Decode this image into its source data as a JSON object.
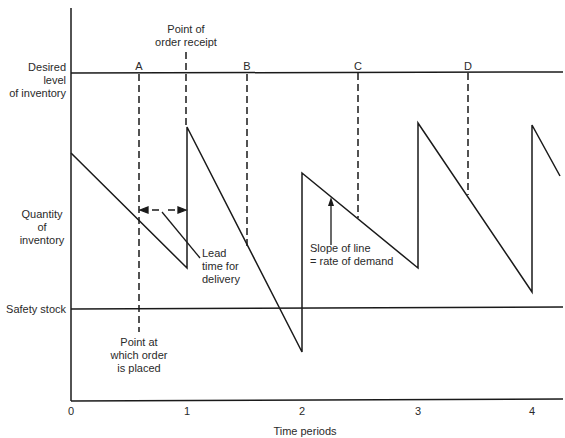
{
  "diagram": {
    "levels": {
      "desired": "Desired level\nof inventory",
      "quantity": "Quantity\nof\ninventory",
      "safety": "Safety stock"
    },
    "order_points": [
      "A",
      "B",
      "C",
      "D"
    ],
    "annotations": {
      "order_receipt": "Point of\norder receipt",
      "order_placed": "Point at\nwhich order\nis placed",
      "lead_time": "Lead\ntime for\ndelivery",
      "slope": "Slope of line\n= rate of demand"
    },
    "x_axis": {
      "label": "Time periods",
      "ticks": [
        "0",
        "1",
        "2",
        "3",
        "4"
      ]
    },
    "colors": {
      "line": "#1a1a1a",
      "background": "#ffffff"
    }
  }
}
